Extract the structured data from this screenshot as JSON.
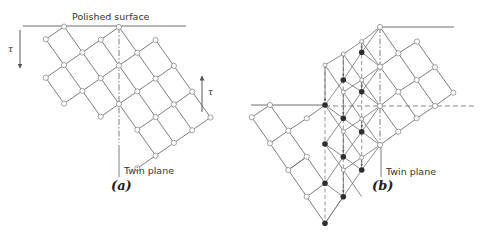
{
  "colors": {
    "line": "#6e6e6e",
    "node_open_fill": "#ffffff",
    "node_open_stroke": "#8a8a8a",
    "node_filled": "#2e2e2e",
    "text": "#333333"
  },
  "panel_a": {
    "caption": "(a)",
    "surface_label": "Polished surface",
    "twin_plane_label": "Twin plane",
    "shear_label_left": "τ",
    "shear_label_right": "τ",
    "surface_line": [
      23,
      26,
      186,
      26
    ],
    "twin_dashdot": [
      119,
      27,
      119,
      143
    ],
    "twin_pointer": [
      119,
      145,
      119,
      177
    ],
    "shear_arrow_left": {
      "x": 20,
      "y1": 30,
      "y2": 68,
      "dir": "down"
    },
    "shear_arrow_right": {
      "x": 202,
      "y1": 112,
      "y2": 76,
      "dir": "up"
    },
    "origin": [
      119,
      27
    ],
    "u": [
      -18.3,
      12.7
    ],
    "v": [
      18.3,
      25.8
    ],
    "nodes": [
      [
        0,
        0
      ],
      [
        1,
        0
      ],
      [
        2,
        0
      ],
      [
        3,
        0
      ],
      [
        4,
        0
      ],
      [
        -1,
        1
      ],
      [
        0,
        1
      ],
      [
        1,
        1
      ],
      [
        2,
        1
      ],
      [
        3,
        1
      ],
      [
        4,
        1
      ],
      [
        -1,
        2
      ],
      [
        0,
        2
      ],
      [
        1,
        2
      ],
      [
        2,
        2
      ],
      [
        3,
        2
      ],
      [
        -1,
        3
      ],
      [
        0,
        3
      ],
      [
        1,
        3
      ],
      [
        2,
        3
      ],
      [
        -1,
        4
      ],
      [
        0,
        4
      ],
      [
        1,
        4
      ],
      [
        2,
        4
      ],
      [
        3,
        4
      ],
      [
        2,
        -1
      ],
      [
        3,
        -1
      ]
    ]
  },
  "panel_b": {
    "caption": "(b)",
    "twin_plane_label": "Twin plane",
    "top_surface_line": [
      380,
      27,
      454,
      27
    ],
    "lower_surface_line": [
      251,
      105,
      325,
      105
    ],
    "dashed_horizontal": [
      325,
      106,
      477,
      106
    ],
    "twin_dashdot": [
      380,
      27,
      380,
      145
    ],
    "twin_pointer": [
      381,
      146,
      381,
      177
    ],
    "right_nodes": [
      [
        380,
        27
      ],
      [
        417,
        41.5
      ],
      [
        398.3,
        53.3
      ],
      [
        380,
        66.7
      ],
      [
        435,
        67.3
      ],
      [
        416.7,
        80
      ],
      [
        398.3,
        91.7
      ],
      [
        453.3,
        92.7
      ],
      [
        435,
        106
      ],
      [
        380,
        106
      ],
      [
        416.7,
        118.3
      ],
      [
        398.3,
        131.7
      ],
      [
        380,
        145
      ]
    ],
    "right_edges": [
      [
        [
          380,
          27
        ],
        [
          398.3,
          53.3
        ]
      ],
      [
        [
          398.3,
          53.3
        ],
        [
          416.7,
          80
        ]
      ],
      [
        [
          416.7,
          80
        ],
        [
          435,
          106
        ]
      ],
      [
        [
          417,
          41.5
        ],
        [
          435,
          67.3
        ]
      ],
      [
        [
          435,
          67.3
        ],
        [
          453.3,
          92.7
        ]
      ],
      [
        [
          380,
          66.7
        ],
        [
          398.3,
          91.7
        ]
      ],
      [
        [
          398.3,
          91.7
        ],
        [
          416.7,
          118.3
        ]
      ],
      [
        [
          380,
          106
        ],
        [
          398.3,
          131.7
        ]
      ],
      [
        [
          417,
          41.5
        ],
        [
          398.3,
          53.3
        ]
      ],
      [
        [
          398.3,
          53.3
        ],
        [
          380,
          66.7
        ]
      ],
      [
        [
          435,
          67.3
        ],
        [
          416.7,
          80
        ]
      ],
      [
        [
          416.7,
          80
        ],
        [
          398.3,
          91.7
        ]
      ],
      [
        [
          398.3,
          91.7
        ],
        [
          380,
          106
        ]
      ],
      [
        [
          453.3,
          92.7
        ],
        [
          435,
          106
        ]
      ],
      [
        [
          435,
          106
        ],
        [
          416.7,
          118.3
        ]
      ],
      [
        [
          416.7,
          118.3
        ],
        [
          398.3,
          131.7
        ]
      ],
      [
        [
          398.3,
          131.7
        ],
        [
          380,
          145
        ]
      ]
    ],
    "left_nodes": [
      [
        270,
        105
      ],
      [
        251.7,
        117.3
      ],
      [
        306.7,
        118.3
      ],
      [
        288.3,
        130.7
      ],
      [
        270,
        143.3
      ],
      [
        306.7,
        156.7
      ],
      [
        288.3,
        170
      ],
      [
        306.7,
        196.7
      ]
    ],
    "left_edges": [
      [
        [
          270,
          105
        ],
        [
          251.7,
          117.3
        ]
      ],
      [
        [
          306.7,
          118.3
        ],
        [
          288.3,
          130.7
        ]
      ],
      [
        [
          288.3,
          130.7
        ],
        [
          270,
          143.3
        ]
      ],
      [
        [
          306.7,
          156.7
        ],
        [
          288.3,
          170
        ]
      ],
      [
        [
          270,
          105
        ],
        [
          288.3,
          130.7
        ]
      ],
      [
        [
          288.3,
          130.7
        ],
        [
          306.7,
          156.7
        ]
      ],
      [
        [
          306.7,
          156.7
        ],
        [
          325,
          183.3
        ]
      ],
      [
        [
          251.7,
          117.3
        ],
        [
          270,
          143.3
        ]
      ],
      [
        [
          270,
          143.3
        ],
        [
          288.3,
          170
        ]
      ],
      [
        [
          288.3,
          170
        ],
        [
          306.7,
          196.7
        ]
      ],
      [
        [
          306.7,
          196.7
        ],
        [
          325,
          223.3
        ]
      ],
      [
        [
          306.7,
          118.3
        ],
        [
          325,
          105
        ]
      ],
      [
        [
          288.3,
          170
        ],
        [
          306.7,
          156.7
        ]
      ],
      [
        [
          306.7,
          196.7
        ],
        [
          325,
          183.3
        ]
      ]
    ],
    "ghost_nodes": [
      [
        325,
        65
      ],
      [
        343.3,
        54
      ],
      [
        361.7,
        41.5
      ],
      [
        343.3,
        92
      ],
      [
        361.7,
        80
      ],
      [
        343.3,
        131.5
      ],
      [
        361.7,
        119
      ],
      [
        343.3,
        170
      ],
      [
        361.7,
        157.5
      ]
    ],
    "filled_nodes": [
      [
        361.7,
        52.3
      ],
      [
        343.3,
        80
      ],
      [
        361.7,
        91.7
      ],
      [
        325,
        105
      ],
      [
        343.3,
        118.3
      ],
      [
        361.7,
        131.7
      ],
      [
        325,
        144
      ],
      [
        343.3,
        156.7
      ],
      [
        361.7,
        170
      ],
      [
        325,
        183.3
      ],
      [
        343.3,
        196.7
      ],
      [
        325,
        223.3
      ]
    ],
    "twin_edges": [
      [
        [
          325,
          105
        ],
        [
          343.3,
          80
        ]
      ],
      [
        [
          343.3,
          80
        ],
        [
          361.7,
          52.3
        ]
      ],
      [
        [
          361.7,
          52.3
        ],
        [
          380,
          27
        ]
      ],
      [
        [
          325,
          144
        ],
        [
          343.3,
          118.3
        ]
      ],
      [
        [
          343.3,
          118.3
        ],
        [
          361.7,
          91.7
        ]
      ],
      [
        [
          361.7,
          91.7
        ],
        [
          380,
          66.7
        ]
      ],
      [
        [
          325,
          183.3
        ],
        [
          343.3,
          156.7
        ]
      ],
      [
        [
          343.3,
          156.7
        ],
        [
          361.7,
          131.7
        ]
      ],
      [
        [
          361.7,
          131.7
        ],
        [
          380,
          106
        ]
      ],
      [
        [
          325,
          223.3
        ],
        [
          343.3,
          196.7
        ]
      ],
      [
        [
          343.3,
          196.7
        ],
        [
          361.7,
          170
        ]
      ],
      [
        [
          361.7,
          170
        ],
        [
          380,
          145
        ]
      ],
      [
        [
          325,
          105
        ],
        [
          343.3,
          118.3
        ]
      ],
      [
        [
          343.3,
          118.3
        ],
        [
          361.7,
          131.7
        ]
      ],
      [
        [
          361.7,
          131.7
        ],
        [
          380,
          145
        ]
      ],
      [
        [
          343.3,
          80
        ],
        [
          361.7,
          91.7
        ]
      ],
      [
        [
          361.7,
          91.7
        ],
        [
          380,
          106
        ]
      ],
      [
        [
          361.7,
          52.3
        ],
        [
          380,
          66.7
        ]
      ],
      [
        [
          325,
          144
        ],
        [
          343.3,
          156.7
        ]
      ],
      [
        [
          343.3,
          156.7
        ],
        [
          361.7,
          170
        ]
      ],
      [
        [
          325,
          183.3
        ],
        [
          343.3,
          196.7
        ]
      ],
      [
        [
          325,
          65
        ],
        [
          343.3,
          54
        ]
      ],
      [
        [
          343.3,
          54
        ],
        [
          361.7,
          41.5
        ]
      ],
      [
        [
          361.7,
          41.5
        ],
        [
          380,
          27
        ]
      ],
      [
        [
          325,
          65
        ],
        [
          343.3,
          92
        ]
      ],
      [
        [
          343.3,
          92
        ],
        [
          361.7,
          119
        ]
      ],
      [
        [
          361.7,
          119
        ],
        [
          380,
          145
        ]
      ],
      [
        [
          343.3,
          54
        ],
        [
          361.7,
          80
        ]
      ],
      [
        [
          361.7,
          80
        ],
        [
          380,
          106
        ]
      ],
      [
        [
          361.7,
          41.5
        ],
        [
          380,
          66.7
        ]
      ],
      [
        [
          343.3,
          92
        ],
        [
          361.7,
          80
        ]
      ],
      [
        [
          361.7,
          80
        ],
        [
          380,
          66.7
        ]
      ],
      [
        [
          343.3,
          131.5
        ],
        [
          361.7,
          119
        ]
      ],
      [
        [
          361.7,
          119
        ],
        [
          380,
          106
        ]
      ],
      [
        [
          325,
          105
        ],
        [
          343.3,
          131.5
        ]
      ],
      [
        [
          343.3,
          131.5
        ],
        [
          361.7,
          157.5
        ]
      ],
      [
        [
          343.3,
          170
        ],
        [
          361.7,
          157.5
        ]
      ],
      [
        [
          361.7,
          157.5
        ],
        [
          380,
          145
        ]
      ],
      [
        [
          325,
          144
        ],
        [
          343.3,
          170
        ]
      ],
      [
        [
          343.3,
          170
        ],
        [
          361.7,
          196.7
        ]
      ],
      [
        [
          325,
          223.3
        ],
        [
          343.3,
          196.7
        ]
      ]
    ],
    "dashed_verticals": [
      [
        325,
        65,
        325,
        223
      ],
      [
        343.3,
        54,
        343.3,
        197
      ],
      [
        361.7,
        41.5,
        361.7,
        170
      ]
    ],
    "displacement_arrows": [
      [
        325,
        67,
        325,
        101
      ],
      [
        343.3,
        56,
        343.3,
        76
      ],
      [
        361.7,
        43,
        361.7,
        48.5
      ],
      [
        343.3,
        94,
        343.3,
        114.5
      ],
      [
        361.7,
        82,
        361.7,
        87.5
      ],
      [
        343.3,
        133.5,
        343.3,
        152.5
      ],
      [
        361.7,
        121,
        361.7,
        127.5
      ],
      [
        343.3,
        172,
        343.3,
        192.5
      ],
      [
        361.7,
        159.5,
        361.7,
        166
      ]
    ]
  }
}
